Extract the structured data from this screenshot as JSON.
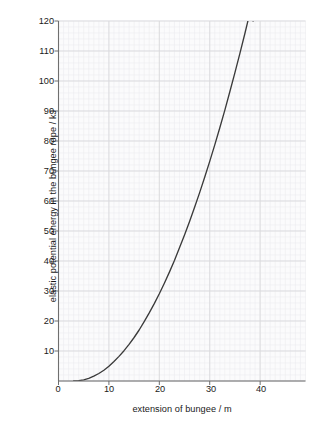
{
  "chart_data": {
    "type": "line",
    "title": "",
    "xlabel": "extension of bungee / m",
    "ylabel": "elastic potential energy in the bungee rope / kJ",
    "xlim": [
      0,
      49
    ],
    "ylim": [
      0,
      120
    ],
    "xticks": [
      0,
      10,
      20,
      30,
      40
    ],
    "yticks": [
      0,
      10,
      20,
      30,
      40,
      50,
      60,
      70,
      80,
      90,
      100,
      110,
      120
    ],
    "xtick_labels": [
      "0",
      "10",
      "20",
      "30",
      "40"
    ],
    "ytick_labels": [
      "10",
      "20",
      "30",
      "40",
      "50",
      "60",
      "70",
      "80",
      "90",
      "100",
      "110",
      "120"
    ],
    "grid": "major and minor grid shown, minor every 1 m and 2 kJ",
    "legend": "none",
    "series": [
      {
        "name": "elastic potential energy",
        "x": [
          3.0,
          4.0,
          5.0,
          6.0,
          7.0,
          8.0,
          9.0,
          10.0,
          11.0,
          12.0,
          13.0,
          14.0,
          15.0,
          16.0,
          17.0,
          18.0,
          19.0,
          20.0,
          21.0,
          22.0,
          23.0,
          24.0,
          25.0,
          26.0,
          27.0,
          28.0,
          29.0,
          30.0,
          31.0,
          32.0,
          33.0,
          34.0,
          35.0,
          36.0,
          37.0,
          38.0,
          38.6
        ],
        "y": [
          0.0,
          0.1,
          0.4,
          0.9,
          1.6,
          2.5,
          3.6,
          4.9,
          6.5,
          8.2,
          10.1,
          12.2,
          14.5,
          17.0,
          19.8,
          22.7,
          25.8,
          29.1,
          32.6,
          36.3,
          40.2,
          44.4,
          48.7,
          53.2,
          57.9,
          62.8,
          67.9,
          73.2,
          78.7,
          84.4,
          90.3,
          96.5,
          102.8,
          109.3,
          116.0,
          123.0,
          120.0
        ]
      }
    ],
    "colors": {
      "curve": "#3b3b3b",
      "axis": "#7a7a7a",
      "major_grid": "#d8d8dc",
      "minor_grid": "#ececf0",
      "plot_background": "#fbfbfc",
      "text": "#1a1a1a"
    }
  }
}
